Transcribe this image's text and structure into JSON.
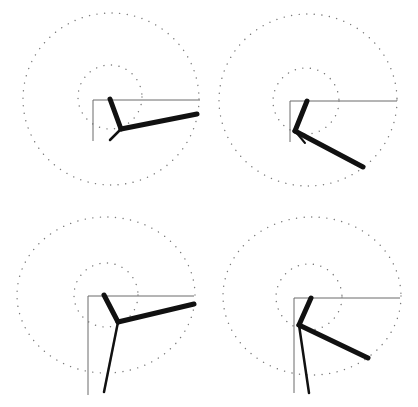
{
  "diagram": {
    "type": "kinematic-chain-panels",
    "colors": {
      "background": "#ffffff",
      "dotted_circle": "#7a7a7a",
      "axis": "#6a6a6a",
      "segment": "#111111"
    },
    "dot_spacing": 7.5,
    "panels": [
      {
        "id": "panel-top-left",
        "outer_circle": {
          "cx": 111,
          "cy": 99,
          "rx": 88,
          "ry": 86
        },
        "inner_circle": {
          "cx": 110,
          "cy": 97,
          "r": 32
        },
        "axes": {
          "origin": [
            93,
            100
          ],
          "x_end": 200,
          "y_end": 141
        },
        "segments": [
          {
            "from": [
              110,
              99
            ],
            "to": [
              121,
              129
            ],
            "width": 5
          },
          {
            "from": [
              121,
              129
            ],
            "to": [
              197,
              114
            ],
            "width": 5
          },
          {
            "from": [
              121,
              129
            ],
            "to": [
              110,
              140
            ],
            "width": 2.5
          }
        ]
      },
      {
        "id": "panel-top-right",
        "outer_circle": {
          "cx": 308,
          "cy": 100,
          "rx": 89,
          "ry": 86
        },
        "inner_circle": {
          "cx": 306,
          "cy": 101,
          "r": 33
        },
        "axes": {
          "origin": [
            290,
            101
          ],
          "x_end": 397,
          "y_end": 142
        },
        "segments": [
          {
            "from": [
              307,
              101
            ],
            "to": [
              295,
              131
            ],
            "width": 5
          },
          {
            "from": [
              295,
              131
            ],
            "to": [
              363,
              167
            ],
            "width": 5
          },
          {
            "from": [
              295,
              131
            ],
            "to": [
              305,
              143
            ],
            "width": 2
          }
        ]
      },
      {
        "id": "panel-bottom-left",
        "outer_circle": {
          "cx": 106,
          "cy": 295,
          "rx": 89,
          "ry": 78
        },
        "inner_circle": {
          "cx": 106,
          "cy": 295,
          "r": 32
        },
        "axes": {
          "origin": [
            88,
            296
          ],
          "x_end": 194,
          "y_end": 395
        },
        "segments": [
          {
            "from": [
              104,
              295
            ],
            "to": [
              118,
              322
            ],
            "width": 5
          },
          {
            "from": [
              118,
              322
            ],
            "to": [
              194,
              304
            ],
            "width": 5
          },
          {
            "from": [
              118,
              322
            ],
            "to": [
              104,
              392
            ],
            "width": 2.5
          }
        ]
      },
      {
        "id": "panel-bottom-right",
        "outer_circle": {
          "cx": 312,
          "cy": 296,
          "rx": 89,
          "ry": 79
        },
        "inner_circle": {
          "cx": 309,
          "cy": 297,
          "r": 33
        },
        "axes": {
          "origin": [
            294,
            298
          ],
          "x_end": 400,
          "y_end": 393
        },
        "segments": [
          {
            "from": [
              311,
              298
            ],
            "to": [
              299,
              325
            ],
            "width": 5
          },
          {
            "from": [
              299,
              325
            ],
            "to": [
              368,
              358
            ],
            "width": 5
          },
          {
            "from": [
              299,
              325
            ],
            "to": [
              309,
              393
            ],
            "width": 2.5
          }
        ]
      }
    ]
  }
}
